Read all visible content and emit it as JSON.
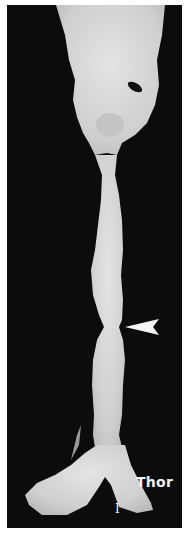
{
  "image": {
    "subject": "3D volume rendering of trachea and main bronchi",
    "background_color": "#0c0c0c",
    "border_color": "#ffffff",
    "structure_color": "#d9d9d9"
  },
  "annotations": {
    "arrowhead": {
      "label": "stenosis-marker",
      "pointing": "left",
      "x": 120,
      "y": 322
    },
    "region_label": "Thor",
    "marker_label": "I"
  }
}
